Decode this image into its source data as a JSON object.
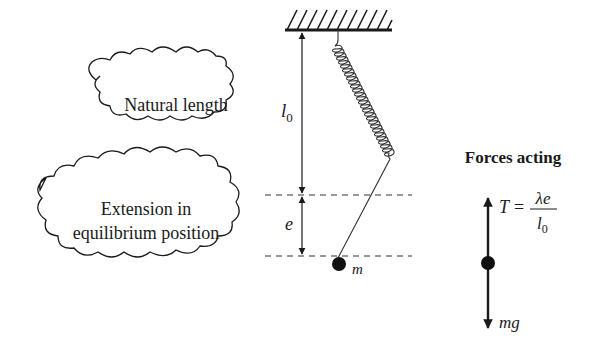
{
  "diagram": {
    "labels": {
      "natural_length": "Natural length",
      "extension_line1": "Extension in",
      "extension_line2": "equilibrium position",
      "l0_symbol": "l",
      "l0_subscript": "0",
      "e_symbol": "e",
      "mass_symbol": "m"
    },
    "forces": {
      "title": "Forces acting",
      "tension_symbol": "T",
      "equals": "=",
      "numerator": "λe",
      "denominator_symbol": "l",
      "denominator_subscript": "0",
      "weight": "mg"
    },
    "colors": {
      "ink": "#1a1a1a",
      "background": "#ffffff"
    }
  }
}
